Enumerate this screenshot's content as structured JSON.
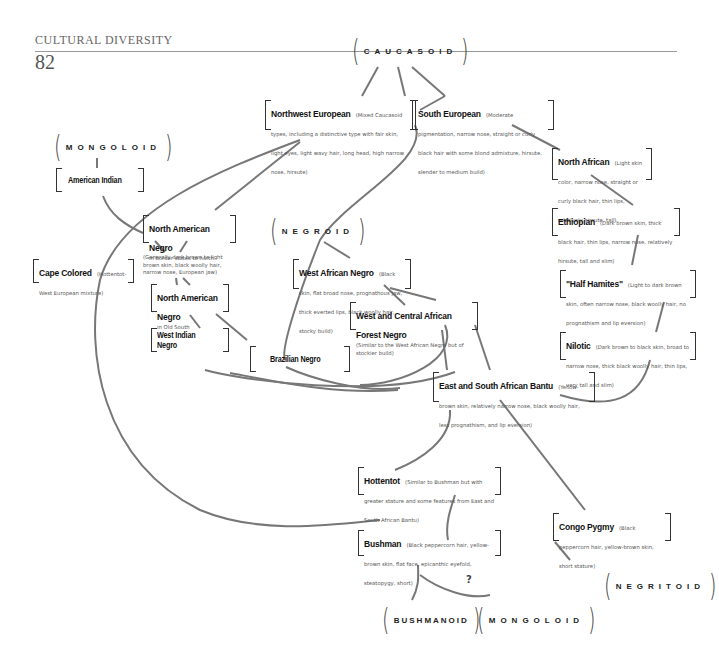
{
  "header": {
    "section_title": "CULTURAL DIVERSITY",
    "page_number": "82"
  },
  "groups": {
    "caucasoid": "CAUCASOID",
    "mongoloid_top": "MONGOLOID",
    "negroid": "NEGROID",
    "negritoid": "NEGRITOID",
    "bushmanoid": "BUSHMANOID",
    "mongoloid_bottom": "MONGOLOID"
  },
  "boxes": {
    "northwest_european": {
      "title": "Northwest European",
      "desc": "(Mixed Caucasoid types, including a distinctive type with fair skin, light eyes, light wavy hair, long head, high narrow nose, hirsute)"
    },
    "south_european": {
      "title": "South European",
      "desc": "(Moderate pigmentation, narrow nose, straight or curly black hair with some blond admixture, hirsute, slender to medium build)"
    },
    "north_african": {
      "title": "North African",
      "desc": "(Light skin color, narrow nose, straight or curly black hair, thin lips, relatively hirsute, tall)"
    },
    "ethiopian": {
      "title": "Ethiopian",
      "desc": "(Dark brown skin, thick black hair, thin lips, narrow nose, relatively hirsute, tall and slim)"
    },
    "half_hamites": {
      "title": "\"Half Hamites\"",
      "desc": "(Light to dark brown skin, often narrow nose, black woolly hair, no prognathism and lip eversion)"
    },
    "nilotic": {
      "title": "Nilotic",
      "desc": "(Dark brown to black skin, broad to narrow nose, thick black woolly hair, thin lips, very tall and slim)"
    },
    "american_indian": {
      "title": "American Indian",
      "desc": ""
    },
    "north_american_negro_border": {
      "title": "North American Negro",
      "desc": "in border states to north"
    },
    "north_american_negro_note": {
      "desc": "(Generally dark brown to light brown skin, black woolly hair, narrow nose, European jaw)"
    },
    "north_american_negro_south": {
      "title": "North American Negro",
      "desc": "in Old South"
    },
    "cape_colored": {
      "title": "Cape Colored",
      "desc": "(Hottentot-West European mixture)"
    },
    "west_indian_negro": {
      "title": "West Indian Negro",
      "desc": ""
    },
    "brazilian_negro": {
      "title": "Brazilian Negro",
      "desc": ""
    },
    "west_african_negro": {
      "title": "West African Negro",
      "desc": "(Black skin, flat broad nose, prognathous jaw, thick everted lips, black woolly hair, stocky build)"
    },
    "west_central_african_forest_negro": {
      "title": "West and Central African Forest Negro",
      "desc": "(Similar to the West African Negro but of stockier build)"
    },
    "east_south_african_bantu": {
      "title": "East and South African Bantu",
      "desc": "(Yellow-brown skin, relatively narrow nose, black woolly hair, less prognathism, and lip eversion)"
    },
    "hottentot": {
      "title": "Hottentot",
      "desc": "(Similar to Bushman but with greater stature and some features from East and South African Bantu)"
    },
    "bushman": {
      "title": "Bushman",
      "desc": "(Black peppercorn hair, yellow-brown skin, flat face, epicanthic eyefold, steatopygy, short)"
    },
    "congo_pygmy": {
      "title": "Congo Pygmy",
      "desc": "(Black peppercorn hair, yellow-brown skin, short stature)"
    }
  },
  "annotations": {
    "uncertain_link": "?"
  }
}
